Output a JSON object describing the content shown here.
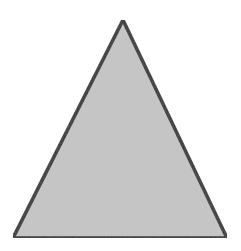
{
  "figure": {
    "shape": "triangle",
    "vertices": [
      [
        123,
        20
      ],
      [
        13,
        238
      ],
      [
        227,
        238
      ]
    ],
    "colors": {
      "background": "#ffffff",
      "fill": "#c6c6c6",
      "stroke": "#2a2a2a"
    },
    "stroke_width": 3.5
  }
}
